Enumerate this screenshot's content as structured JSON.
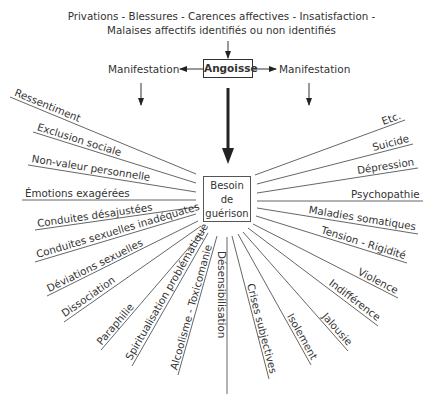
{
  "header": {
    "line1": "Privations - Blessures - Carences affectives - Insatisfaction -",
    "line2": "Malaises affectifs identifiés ou non identifiés"
  },
  "center_top": {
    "angoisse": "Angoisse",
    "manifestation_left": "Manifestation",
    "manifestation_right": "Manifestation"
  },
  "center_box": {
    "line1": "Besoin",
    "line2": "de",
    "line3": "guérison"
  },
  "rays": [
    {
      "label": "Ressentiment",
      "x1": 10,
      "y1": 97,
      "x2": 196,
      "y2": 174
    },
    {
      "label": "Exclusion sociale",
      "x1": 33,
      "y1": 132,
      "x2": 196,
      "y2": 183
    },
    {
      "label": "Non-valeur personnelle",
      "x1": 28,
      "y1": 165,
      "x2": 196,
      "y2": 192
    },
    {
      "label": "Émotions exagérées",
      "x1": 22,
      "y1": 200,
      "x2": 196,
      "y2": 200
    },
    {
      "label": "Conduites désajustées",
      "x1": 35,
      "y1": 230,
      "x2": 196,
      "y2": 207
    },
    {
      "label": "Conduites sexuelles inadéquates",
      "x1": 35,
      "y1": 262,
      "x2": 196,
      "y2": 214
    },
    {
      "label": "Déviations sexuelles",
      "x1": 47,
      "y1": 296,
      "x2": 198,
      "y2": 221
    },
    {
      "label": "Dissociation",
      "x1": 64,
      "y1": 322,
      "x2": 201,
      "y2": 226
    },
    {
      "label": "Paraphilie",
      "x1": 101,
      "y1": 350,
      "x2": 204,
      "y2": 230
    },
    {
      "label": "Spiritualisation problématique",
      "x1": 132,
      "y1": 366,
      "x2": 208,
      "y2": 233
    },
    {
      "label": "Alcoolisme - Toxicomanie",
      "x1": 178,
      "y1": 375,
      "x2": 217,
      "y2": 236
    },
    {
      "label": "Désensibilisation",
      "x1": 227,
      "y1": 394,
      "x2": 227,
      "y2": 237
    },
    {
      "label": "Crises subjectives",
      "x1": 269,
      "y1": 379,
      "x2": 232,
      "y2": 236
    },
    {
      "label": "Isolement",
      "x1": 311,
      "y1": 365,
      "x2": 238,
      "y2": 234
    },
    {
      "label": "Jalousie",
      "x1": 348,
      "y1": 351,
      "x2": 243,
      "y2": 232
    },
    {
      "label": "Indifférence",
      "x1": 378,
      "y1": 326,
      "x2": 248,
      "y2": 228
    },
    {
      "label": "Violence",
      "x1": 398,
      "y1": 298,
      "x2": 253,
      "y2": 224
    },
    {
      "label": "Tension - Rigidité",
      "x1": 407,
      "y1": 263,
      "x2": 256,
      "y2": 216
    },
    {
      "label": "Maladies somatiques",
      "x1": 418,
      "y1": 234,
      "x2": 257,
      "y2": 208
    },
    {
      "label": "Psychopathie",
      "x1": 423,
      "y1": 201,
      "x2": 257,
      "y2": 201
    },
    {
      "label": "Dépression",
      "x1": 418,
      "y1": 168,
      "x2": 257,
      "y2": 193
    },
    {
      "label": "Suicide",
      "x1": 413,
      "y1": 144,
      "x2": 257,
      "y2": 184
    },
    {
      "label": "Etc.",
      "x1": 405,
      "y1": 120,
      "x2": 255,
      "y2": 175
    }
  ]
}
